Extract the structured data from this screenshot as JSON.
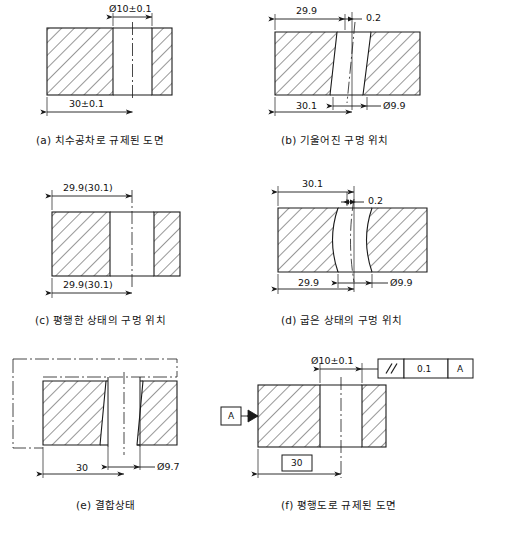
{
  "document": {
    "type": "engineering-drawing-figure-sheet",
    "language": "ko",
    "line_color": "#1a1a1a",
    "background": "#ffffff"
  },
  "panels": [
    {
      "id": "a",
      "caption": "(a) 치수공차로 규제된 도면",
      "description": "block with straight hole, dimension-tolerance controlled",
      "dimensions": [
        {
          "name": "hole-diameter",
          "text": "Ø10±0.1",
          "position": "top"
        },
        {
          "name": "hole-location",
          "text": "30±0.1",
          "position": "bottom"
        }
      ]
    },
    {
      "id": "b",
      "caption": "(b) 기울어진 구멍 위치",
      "description": "block with tilted (inclined) hole",
      "dimensions": [
        {
          "name": "upper-location",
          "text": "29.9",
          "position": "top-left"
        },
        {
          "name": "tilt-offset",
          "text": "0.2",
          "position": "top-right"
        },
        {
          "name": "lower-location",
          "text": "30.1",
          "position": "bottom-left"
        },
        {
          "name": "hole-diameter",
          "text": "Ø9.9",
          "position": "bottom-right"
        }
      ]
    },
    {
      "id": "c",
      "caption": "(c) 평행한 상태의 구멍 위치",
      "description": "block with parallel (straight) hole",
      "dimensions": [
        {
          "name": "upper-location",
          "text": "29.9(30.1)",
          "position": "top"
        },
        {
          "name": "lower-location",
          "text": "29.9(30.1)",
          "position": "bottom"
        }
      ]
    },
    {
      "id": "d",
      "caption": "(d) 굽은 상태의 구멍 위치",
      "description": "block with bowed (curved) hole walls",
      "dimensions": [
        {
          "name": "upper-location",
          "text": "30.1",
          "position": "top-left"
        },
        {
          "name": "bow-offset",
          "text": "0.2",
          "position": "top-right"
        },
        {
          "name": "lower-location",
          "text": "29.9",
          "position": "bottom-left"
        },
        {
          "name": "hole-diameter",
          "text": "Ø9.9",
          "position": "bottom-right"
        }
      ]
    },
    {
      "id": "e",
      "caption": "(e) 결합상태",
      "description": "assembled / mating condition with phantom outline",
      "dimensions": [
        {
          "name": "hole-location",
          "text": "30",
          "position": "bottom-left"
        },
        {
          "name": "pin-diameter",
          "text": "Ø9.7",
          "position": "bottom-right"
        }
      ]
    },
    {
      "id": "f",
      "caption": "(f) 평행도로 규제된 도면",
      "description": "block controlled by parallelism geometric tolerance",
      "dimensions": [
        {
          "name": "hole-diameter",
          "text": "Ø10±0.1",
          "position": "top"
        },
        {
          "name": "basic-location",
          "text": "30",
          "position": "bottom",
          "boxed": true
        }
      ],
      "feature_control_frame": {
        "symbol": "parallelism-symbol",
        "symbol_glyph": "∥",
        "tolerance": "0.1",
        "datum": "A"
      },
      "datum_feature": {
        "label": "A",
        "name": "datum-a-symbol"
      }
    }
  ]
}
